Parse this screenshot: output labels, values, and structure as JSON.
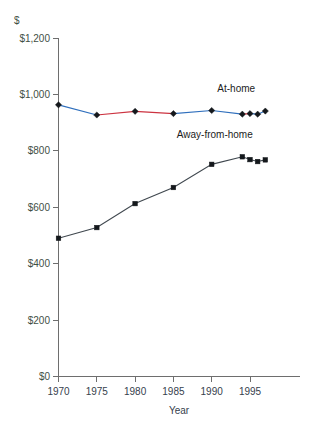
{
  "chart_data": {
    "type": "line",
    "title": "",
    "xlabel": "Year",
    "ylabel": "$",
    "unit_label": "$",
    "xlim": [
      1970,
      1997.5
    ],
    "ylim": [
      0,
      1200
    ],
    "grid": false,
    "legend_position": "inline-annotation",
    "x_ticks": [
      "1970",
      "1975",
      "1980",
      "1985",
      "1990",
      "1995"
    ],
    "x_tick_values": [
      1970,
      1975,
      1980,
      1985,
      1990,
      1995
    ],
    "y_ticks": [
      "$0",
      "$200",
      "$400",
      "$600",
      "$800",
      "$1,000",
      "$1,200"
    ],
    "y_tick_values": [
      0,
      200,
      400,
      600,
      800,
      1000,
      1200
    ],
    "series": [
      {
        "name": "At-home",
        "marker": "diamond",
        "color": "#2f6fbd",
        "accent_color": "#cc3340",
        "x": [
          1970,
          1975,
          1980,
          1985,
          1990,
          1994,
          1995,
          1996,
          1997
        ],
        "values": [
          963,
          927,
          940,
          932,
          943,
          930,
          932,
          930,
          941
        ],
        "label_x": 1993.2,
        "label_y": 1010
      },
      {
        "name": "Away-from-home",
        "marker": "square",
        "color": "#40484f",
        "x": [
          1970,
          1975,
          1980,
          1985,
          1990,
          1994,
          1995,
          1996,
          1997
        ],
        "values": [
          490,
          528,
          613,
          670,
          752,
          779,
          769,
          762,
          768
        ],
        "label_x": 1990.4,
        "label_y": 845
      }
    ]
  },
  "annotations": {
    "at_home_label": "At-home",
    "away_from_home_label": "Away-from-home"
  }
}
